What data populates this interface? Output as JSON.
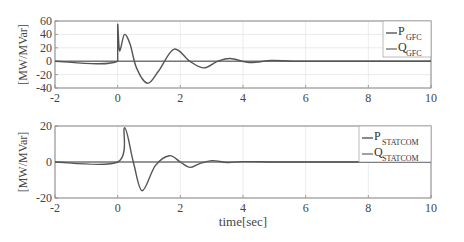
{
  "chart_data": [
    {
      "type": "line",
      "title": "",
      "xlabel": "",
      "ylabel": "[MW/MVar]",
      "xlim": [
        -2,
        10
      ],
      "ylim": [
        -40,
        60
      ],
      "xticks": [
        "-2",
        "0",
        "2",
        "4",
        "6",
        "8",
        "10"
      ],
      "yticks": [
        "60",
        "40",
        "20",
        "0",
        "-20",
        "-40"
      ],
      "grid": true,
      "legend_position": "upper right",
      "series": [
        {
          "name": "P_GFC",
          "label_main": "P",
          "label_sub": "GFC",
          "x": [
            -2,
            0,
            0,
            0.05,
            0.1,
            0.22,
            0.4,
            0.6,
            0.95,
            1.3,
            1.8,
            2.3,
            2.75,
            3.2,
            3.6,
            4.2,
            4.9,
            5.6,
            6.5,
            8,
            10
          ],
          "y": [
            0,
            0,
            55,
            18,
            20,
            40,
            25,
            -10,
            -33,
            -15,
            18,
            0,
            -10,
            0,
            4,
            -2,
            1,
            0,
            0,
            0,
            0
          ]
        },
        {
          "name": "Q_GFC",
          "label_main": "Q",
          "label_sub": "GFC",
          "x": [
            -2,
            10
          ],
          "y": [
            0,
            0
          ]
        }
      ]
    },
    {
      "type": "line",
      "title": "",
      "xlabel": "time[sec]",
      "ylabel": "[MW/MVar]",
      "xlim": [
        -2,
        10
      ],
      "ylim": [
        -20,
        20
      ],
      "xticks": [
        "-2",
        "0",
        "2",
        "4",
        "6",
        "8",
        "10"
      ],
      "yticks": [
        "20",
        "0",
        "-20"
      ],
      "grid": true,
      "legend_position": "upper right",
      "series": [
        {
          "name": "P_STATCOM",
          "label_main": "P",
          "label_sub": "STATCOM",
          "x": [
            -2,
            0,
            0.22,
            0.5,
            0.78,
            1.2,
            1.65,
            2.0,
            2.3,
            2.6,
            3.0,
            3.5,
            4.0,
            5.0,
            6.0,
            8.0,
            10
          ],
          "y": [
            0,
            0,
            19,
            0,
            -16,
            -2,
            3.5,
            0,
            -3,
            -1,
            0.8,
            -0.3,
            0.2,
            0,
            0,
            0,
            0
          ]
        },
        {
          "name": "Q_STATCOM",
          "label_main": "Q",
          "label_sub": "STATCOM",
          "x": [
            -2,
            10
          ],
          "y": [
            0,
            0
          ]
        }
      ]
    }
  ],
  "colors": {
    "P": "#555555",
    "Q": "#777777",
    "axes": "#888888",
    "grid": "#e6e6e6"
  }
}
